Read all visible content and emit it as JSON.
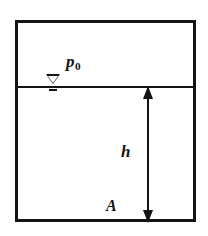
{
  "figure": {
    "type": "hydrostatics-tank-diagram",
    "width": 208,
    "height": 236,
    "background_color": "#ffffff",
    "line_color": "#141414"
  },
  "tank": {
    "name": "container-outline",
    "border_width_px": 3
  },
  "surface": {
    "name": "free-surface-line",
    "symbol": "water-level-triangle"
  },
  "labels": {
    "pressure": {
      "base": "p",
      "subscript": "0",
      "full": "p0"
    },
    "depth": "h",
    "area": "A"
  },
  "dimension": {
    "name": "depth-dimension-arrow",
    "orientation": "vertical",
    "arrowheads": "both",
    "label": "h"
  },
  "chart_data": {
    "type": "diagram",
    "title": "",
    "elements": [
      {
        "kind": "rectangle",
        "role": "tank-walls",
        "x": 15,
        "y": 20,
        "width": 181,
        "height": 202
      },
      {
        "kind": "line",
        "role": "free-surface",
        "x1": 15,
        "y1": 87,
        "x2": 196,
        "y2": 87
      },
      {
        "kind": "symbol",
        "role": "free-surface-marker",
        "x": 53,
        "y": 83
      },
      {
        "kind": "text",
        "role": "pressure-label",
        "text": "p0",
        "x": 66,
        "y": 53
      },
      {
        "kind": "arrow",
        "role": "depth-dimension",
        "x": 147,
        "y1": 87,
        "y2": 222,
        "heads": "both"
      },
      {
        "kind": "text",
        "role": "depth-label",
        "text": "h",
        "x": 121,
        "y": 143
      },
      {
        "kind": "text",
        "role": "area-label",
        "text": "A",
        "x": 106,
        "y": 198
      }
    ]
  }
}
